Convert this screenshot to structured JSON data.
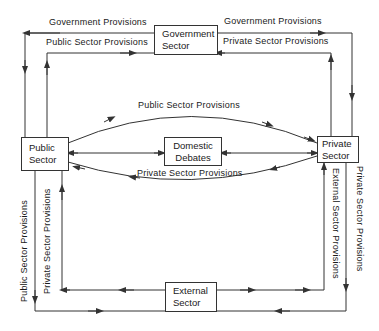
{
  "nodes": {
    "government": {
      "line1": "Government",
      "line2": "Sector"
    },
    "public": {
      "line1": "Public",
      "line2": "Sector"
    },
    "private": {
      "line1": "Private",
      "line2": "Sector"
    },
    "domestic": {
      "line1": "Domestic",
      "line2": "Debates"
    },
    "external": {
      "line1": "External",
      "line2": "Sector"
    }
  },
  "edges": {
    "gov_to_public": "Government  Provisions",
    "public_to_gov": "Public  Sector  Provisions",
    "gov_to_private": "Government  Provisions",
    "private_to_gov": "Private  Sector  Provisions",
    "public_to_private_arc": "Public  Sector  Provisions",
    "private_to_public_arc": "Private  Sector  Provisions",
    "public_to_external": "Public  Sector  Provisions",
    "external_to_public": "Private  Sector  Provisions",
    "external_to_private": "External  Sector  Provisions",
    "private_to_external": "Private  Sector  Provisions"
  },
  "colors": {
    "line": "#333333",
    "text": "#1a1a1a",
    "background": "#ffffff"
  }
}
